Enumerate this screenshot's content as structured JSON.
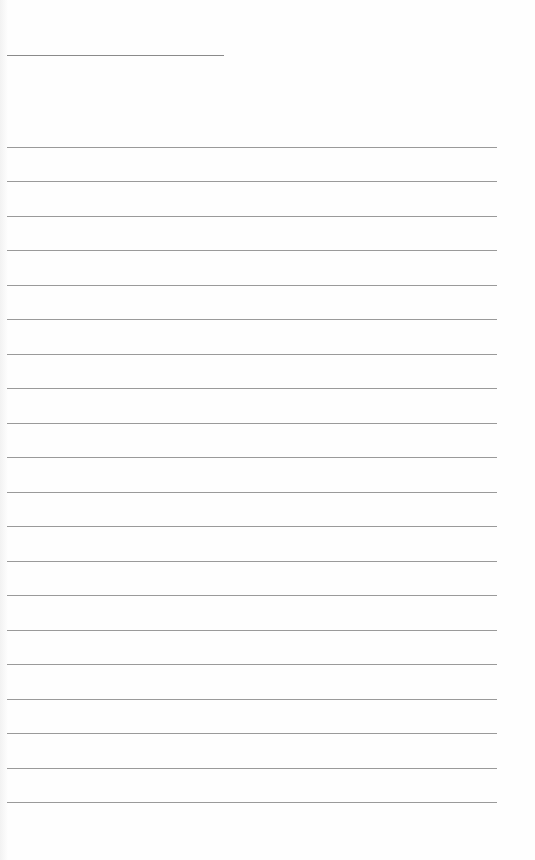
{
  "page": {
    "type": "lined-paper",
    "background_color": "#fefefe",
    "line_color": "#9a9a9a",
    "header_line": {
      "y": 55,
      "x_start": 7,
      "x_end": 224
    },
    "rules": {
      "count": 20,
      "first_y": 147,
      "spacing": 34.5,
      "x_start": 7,
      "x_end": 497
    },
    "text": []
  }
}
